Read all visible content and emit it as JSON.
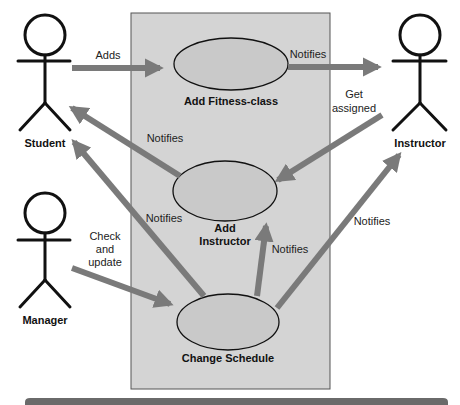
{
  "diagram": {
    "type": "uml-use-case",
    "colors": {
      "boundary_fill": "#d4d4d4",
      "boundary_stroke": "#555555",
      "usecase_fill": "#c9c9c9",
      "arrow": "#7a7a7a",
      "actor": "#111111",
      "bottom_bar": "#6a6a6a"
    },
    "actors": [
      {
        "id": "student",
        "label": "Student"
      },
      {
        "id": "instructor",
        "label": "Instructor"
      },
      {
        "id": "manager",
        "label": "Manager"
      }
    ],
    "use_cases": [
      {
        "id": "add_fitness_class",
        "label": "Add Fitness-class"
      },
      {
        "id": "add_instructor",
        "label_line1": "Add",
        "label_line2": "Instructor"
      },
      {
        "id": "change_schedule",
        "label": "Change Schedule"
      }
    ],
    "relations": [
      {
        "from": "student",
        "to": "add_fitness_class",
        "label": "Adds"
      },
      {
        "from": "add_fitness_class",
        "to": "instructor",
        "label": "Notifies"
      },
      {
        "from": "instructor",
        "to": "add_instructor",
        "label_line1": "Get",
        "label_line2": "assigned"
      },
      {
        "from": "add_instructor",
        "to": "student",
        "label": "Notifies"
      },
      {
        "from": "change_schedule",
        "to": "student",
        "label": "Notifies"
      },
      {
        "from": "manager",
        "to": "change_schedule",
        "label_line1": "Check",
        "label_line2": "and",
        "label_line3": "update"
      },
      {
        "from": "change_schedule",
        "to": "add_instructor",
        "label": "Notifies"
      },
      {
        "from": "change_schedule",
        "to": "instructor",
        "label": "Notifies"
      }
    ]
  }
}
